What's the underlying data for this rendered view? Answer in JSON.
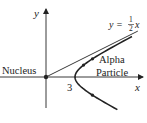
{
  "diagram": {
    "axes": {
      "x_label": "x",
      "y_label": "y"
    },
    "asymptote": {
      "equation_prefix": "y = ",
      "fraction_numerator": "1",
      "fraction_denominator": "2",
      "equation_suffix": "x",
      "slope": 0.5
    },
    "hyperbola": {
      "vertex_x": 3,
      "vertex_label": "3",
      "a": 3,
      "b": 1.5
    },
    "labels": {
      "nucleus": "Nucleus",
      "particle_line1": "Alpha",
      "particle_line2": "Particle"
    },
    "colors": {
      "ink": "#222222",
      "background": "#ffffff"
    }
  }
}
